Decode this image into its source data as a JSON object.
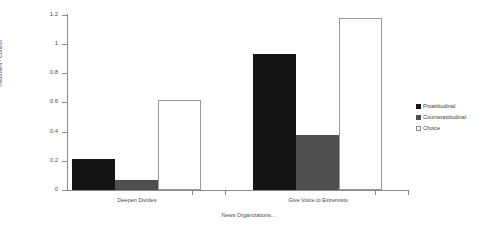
{
  "chart_data": {
    "type": "bar",
    "title": "",
    "xlabel": "News Organizations...",
    "ylabel": "Treatment - Control",
    "categories": [
      "Deepen Divides",
      "Give Voice to Extremists"
    ],
    "series": [
      {
        "name": "Proattitudinal",
        "values": [
          0.21,
          0.93
        ],
        "color": "#141414",
        "marker": "filled-square-black"
      },
      {
        "name": "Counterattitudinal",
        "values": [
          0.07,
          0.38
        ],
        "color": "#4f4f4f",
        "marker": "filled-square-gray"
      },
      {
        "name": "Choice",
        "values": [
          0.62,
          1.18
        ],
        "color": "#ffffff",
        "marker": "open-square"
      }
    ],
    "ylim": [
      0,
      1.2
    ],
    "ytick_labels": [
      "0",
      "0.2",
      "0.4",
      "0.6",
      "0.8",
      "1",
      "1.2"
    ],
    "ytick_values": [
      0,
      0.2,
      0.4,
      0.6,
      0.8,
      1.0,
      1.2
    ],
    "grid": false,
    "legend_position": "right"
  },
  "axes": {
    "y_title": "Treatment - Control",
    "x_title": "News Organizations..."
  },
  "legend": {
    "items": [
      {
        "label": "Proattitudinal"
      },
      {
        "label": "Counterattitudinal"
      },
      {
        "label": "Choice"
      }
    ]
  }
}
